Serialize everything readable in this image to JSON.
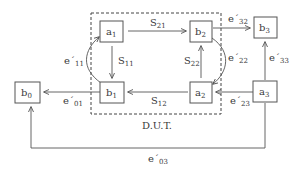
{
  "diagram": {
    "type": "signal-flow-graph",
    "boundary": {
      "label": "D.U.T.",
      "style": "dashed"
    },
    "nodes": [
      {
        "id": "a1",
        "base": "a",
        "sub": "1"
      },
      {
        "id": "b2",
        "base": "b",
        "sub": "2"
      },
      {
        "id": "b3",
        "base": "b",
        "sub": "3"
      },
      {
        "id": "b1",
        "base": "b",
        "sub": "1"
      },
      {
        "id": "a2",
        "base": "a",
        "sub": "2"
      },
      {
        "id": "a3",
        "base": "a",
        "sub": "3"
      },
      {
        "id": "b0",
        "base": "b",
        "sub": "0"
      }
    ],
    "edges": [
      {
        "from": "a1",
        "to": "b2",
        "base": "S",
        "sub": "21"
      },
      {
        "from": "a1",
        "to": "b1",
        "base": "S",
        "sub": "11"
      },
      {
        "from": "a2",
        "to": "b2",
        "base": "S",
        "sub": "22"
      },
      {
        "from": "a2",
        "to": "b1",
        "base": "S",
        "sub": "12"
      },
      {
        "from": "b1",
        "to": "a1",
        "base": "e´",
        "sub": "11"
      },
      {
        "from": "b1",
        "to": "b0",
        "base": "e´",
        "sub": "01"
      },
      {
        "from": "b2",
        "to": "b3",
        "base": "e´",
        "sub": "32"
      },
      {
        "from": "b2",
        "to": "a2",
        "base": "e´",
        "sub": "22"
      },
      {
        "from": "a3",
        "to": "a2",
        "base": "e´",
        "sub": "23"
      },
      {
        "from": "a3",
        "to": "b3",
        "base": "e´",
        "sub": "33"
      },
      {
        "from": "a3",
        "to": "b0",
        "base": "e´",
        "sub": "03"
      }
    ]
  }
}
